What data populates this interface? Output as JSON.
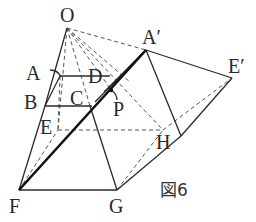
{
  "figure": {
    "caption": "図6",
    "caption_prefix": "図",
    "caption_number": "6"
  },
  "labels": {
    "O": "O",
    "A_prime": "A′",
    "E_prime": "E′",
    "A": "A",
    "D": "D",
    "B": "B",
    "C": "C",
    "E": "E",
    "P": "P",
    "H": "H",
    "F": "F",
    "G": "G"
  },
  "colors": {
    "line": "#2a2a2a",
    "thick_line": "#111111",
    "dashed_line": "#555555",
    "background": "#ffffff"
  }
}
